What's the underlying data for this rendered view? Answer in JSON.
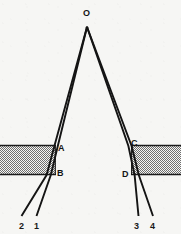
{
  "figure": {
    "background_color": "#f6f6f4",
    "ink_color": "#141414",
    "hatch_color": "#6e6e6e",
    "width": 181,
    "height": 234,
    "apex": {
      "label": "O",
      "x": 87,
      "y": 27,
      "label_x": 83,
      "label_y": 9
    },
    "point_labels": [
      {
        "id": "A",
        "text": "A",
        "x": 58,
        "y": 144,
        "desc": "entry point of left ray pair into left glass block"
      },
      {
        "id": "B",
        "text": "B",
        "x": 57,
        "y": 169,
        "desc": "exit point of left ray pair from left glass block"
      },
      {
        "id": "C",
        "text": "C",
        "x": 131,
        "y": 139,
        "desc": "entry point of right ray pair into right glass block"
      },
      {
        "id": "D",
        "text": "D",
        "x": 122,
        "y": 170,
        "desc": "exit point of right ray pair from right glass block"
      }
    ],
    "ray_labels": [
      {
        "id": "2",
        "text": "2",
        "x": 19,
        "y": 222,
        "desc": "outer emergent ray, left side"
      },
      {
        "id": "1",
        "text": "1",
        "x": 34,
        "y": 222,
        "desc": "inner emergent ray, left side"
      },
      {
        "id": "3",
        "text": "3",
        "x": 134,
        "y": 222,
        "desc": "inner emergent ray, right side"
      },
      {
        "id": "4",
        "text": "4",
        "x": 150,
        "y": 222,
        "desc": "outer emergent ray, right side"
      }
    ],
    "blocks": [
      {
        "id": "left-block",
        "x": 0,
        "y": 145,
        "width": 56,
        "height": 30,
        "fill": "hatched-gray"
      },
      {
        "id": "right-block",
        "x": 131,
        "y": 145,
        "width": 50,
        "height": 30,
        "fill": "hatched-gray"
      }
    ],
    "rays": {
      "left_inner": {
        "from": [
          87,
          27
        ],
        "to_entry": [
          57.5,
          146
        ],
        "to_exit": [
          50.5,
          175
        ],
        "to_end": [
          37,
          215
        ]
      },
      "left_outer": {
        "from": [
          87,
          27
        ],
        "to_entry": [
          54.5,
          146
        ],
        "to_exit": [
          46.5,
          175
        ],
        "to_end": [
          22,
          215
        ]
      },
      "right_inner": {
        "from": [
          87,
          27
        ],
        "to_entry": [
          128.5,
          146
        ],
        "to_exit": [
          134.5,
          175
        ],
        "to_end": [
          138,
          215
        ]
      },
      "right_outer": {
        "from": [
          87,
          27
        ],
        "to_entry": [
          131.5,
          146
        ],
        "to_exit": [
          138.5,
          175
        ],
        "to_end": [
          153,
          215
        ]
      }
    }
  }
}
